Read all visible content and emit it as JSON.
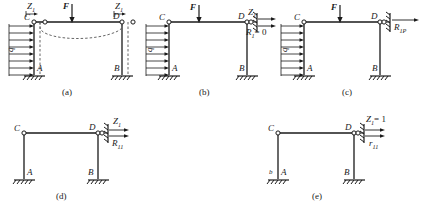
{
  "figure": {
    "stroke_color": "#1a1a1a",
    "dashed_color": "#555555"
  },
  "panels": [
    {
      "id": "a",
      "caption": "(a)",
      "nodes": {
        "topleft": "C",
        "topright": "D",
        "botleft": "A",
        "botright": "B"
      },
      "loads": {
        "distributed": "q",
        "point": "F"
      },
      "unknowns": [
        {
          "text": "Z",
          "sub": "1"
        },
        {
          "text": "Z",
          "sub": "1"
        }
      ],
      "has_deflection_curve": true,
      "has_added_support": false
    },
    {
      "id": "b",
      "caption": "(b)",
      "nodes": {
        "topleft": "C",
        "topright": "D",
        "botleft": "A",
        "botright": "B"
      },
      "loads": {
        "distributed": "q",
        "point": "F"
      },
      "unknowns": [
        {
          "text": "Z",
          "sub": "1"
        }
      ],
      "reaction": {
        "text": "R",
        "sub": "1",
        "value": "= 0"
      },
      "has_deflection_curve": false,
      "has_added_support": true
    },
    {
      "id": "c",
      "caption": "(c)",
      "nodes": {
        "topleft": "C",
        "topright": "D",
        "botleft": "A",
        "botright": "B"
      },
      "loads": {
        "distributed": "q",
        "point": "F"
      },
      "unknowns": [],
      "reaction": {
        "text": "R",
        "sub": "1P",
        "value": ""
      },
      "has_deflection_curve": false,
      "has_added_support": true
    },
    {
      "id": "d",
      "caption": "(d)",
      "nodes": {
        "topleft": "C",
        "topright": "D",
        "botleft": "A",
        "botright": "B"
      },
      "loads": {
        "distributed": "",
        "point": ""
      },
      "unknowns": [
        {
          "text": "Z",
          "sub": "1"
        }
      ],
      "reaction": {
        "text": "R",
        "sub": "11",
        "value": ""
      },
      "has_deflection_curve": false,
      "has_added_support": true
    },
    {
      "id": "e",
      "caption": "(e)",
      "nodes": {
        "topleft": "C",
        "topright": "D",
        "botleft": "A",
        "botright": "B",
        "extra": "b"
      },
      "loads": {
        "distributed": "",
        "point": ""
      },
      "unknowns": [
        {
          "text": "Z",
          "sub": "1",
          "value": "= 1"
        }
      ],
      "reaction": {
        "text": "r",
        "sub": "11",
        "value": ""
      },
      "has_deflection_curve": false,
      "has_added_support": true
    }
  ],
  "labels": {
    "a_Z1_left": "Z",
    "a_Z1_left_sub": "1",
    "a_Z1_right": "Z",
    "a_Z1_right_sub": "1",
    "a_F": "F",
    "a_q": "q",
    "a_C": "C",
    "a_D": "D",
    "a_A": "A",
    "a_B": "B",
    "a_caption": "(a)",
    "b_F": "F",
    "b_q": "q",
    "b_C": "C",
    "b_D": "D",
    "b_A": "A",
    "b_B": "B",
    "b_Z1": "Z",
    "b_Z1_sub": "1",
    "b_R1": "R",
    "b_R1_sub": "1",
    "b_R1_eq": "= 0",
    "b_caption": "(b)",
    "c_F": "F",
    "c_q": "q",
    "c_C": "C",
    "c_D": "D",
    "c_A": "A",
    "c_B": "B",
    "c_R1P": "R",
    "c_R1P_sub": "1P",
    "c_caption": "(c)",
    "d_C": "C",
    "d_D": "D",
    "d_A": "A",
    "d_B": "B",
    "d_Z1": "Z",
    "d_Z1_sub": "1",
    "d_R11": "R",
    "d_R11_sub": "11",
    "d_caption": "(d)",
    "e_C": "C",
    "e_D": "D",
    "e_A": "A",
    "e_B": "B",
    "e_b": "b",
    "e_Z1": "Z",
    "e_Z1_sub": "1",
    "e_Z1_eq": "= 1",
    "e_r11": "r",
    "e_r11_sub": "11",
    "e_caption": "(e)"
  }
}
